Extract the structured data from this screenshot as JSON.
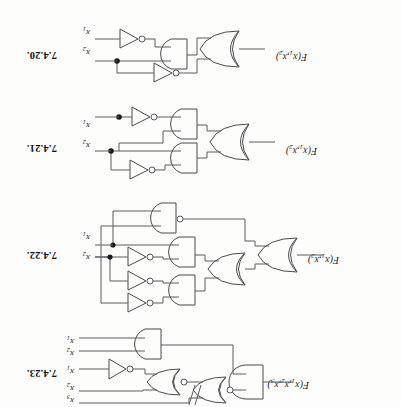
{
  "document": {
    "kind": "textbook-exercise-page-scan",
    "orientation": "rotated-180",
    "background_color": "#fdfdfc",
    "ink_color": "#4a4a50"
  },
  "figures": [
    {
      "number": "7.4.23.",
      "output_label": "F(x1,x2,x3)",
      "output_label_plain": "F",
      "output_subscripts": [
        "1",
        "2",
        "3"
      ],
      "inputs": [
        {
          "name": "x3",
          "base": "x",
          "sub": "3"
        },
        {
          "name": "x2",
          "base": "x",
          "sub": "2"
        },
        {
          "name": "x1",
          "base": "x",
          "sub": "1"
        },
        {
          "name": "x2b",
          "base": "x",
          "sub": "2"
        },
        {
          "name": "x1b",
          "base": "x",
          "sub": "1"
        }
      ],
      "gates": [
        "AND",
        "NOR",
        "NOR",
        "NOT",
        "AND"
      ]
    },
    {
      "number": "7.4.22.",
      "output_label": "F(x1,x2)",
      "output_label_plain": "F",
      "output_subscripts": [
        "1",
        "2"
      ],
      "inputs": [
        {
          "name": "x2",
          "base": "x",
          "sub": "2"
        },
        {
          "name": "x1",
          "base": "x",
          "sub": "1"
        }
      ],
      "gates": [
        "OR",
        "OR",
        "AND",
        "AND",
        "NAND",
        "NOT",
        "NOT",
        "NOT"
      ]
    },
    {
      "number": "7.4.21.",
      "output_label": "F(x1,x2)",
      "output_label_plain": "F",
      "output_subscripts": [
        "1",
        "2"
      ],
      "inputs": [
        {
          "name": "x2",
          "base": "x",
          "sub": "2"
        },
        {
          "name": "x1",
          "base": "x",
          "sub": "1"
        }
      ],
      "gates": [
        "OR",
        "AND",
        "AND",
        "NOT",
        "NOT"
      ]
    },
    {
      "number": "7.4.20.",
      "output_label": "F(x1,x2)",
      "output_label_plain": "F",
      "output_subscripts": [
        "1",
        "2"
      ],
      "inputs": [
        {
          "name": "x2",
          "base": "x",
          "sub": "2"
        },
        {
          "name": "x1",
          "base": "x",
          "sub": "1"
        }
      ],
      "gates": [
        "OR",
        "AND",
        "NOT",
        "NOT"
      ]
    }
  ]
}
